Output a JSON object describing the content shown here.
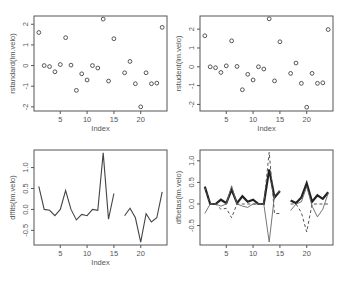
{
  "chart_data": [
    {
      "type": "scatter",
      "title": "",
      "xlabel": "Index",
      "ylabel": "rstandard(lm.velo)",
      "x": [
        1,
        2,
        3,
        4,
        5,
        6,
        7,
        8,
        9,
        10,
        11,
        12,
        13,
        14,
        15,
        16,
        17,
        18,
        19,
        20,
        21,
        22,
        23,
        24
      ],
      "values": [
        1.6,
        0.0,
        -0.05,
        -0.3,
        0.05,
        1.35,
        0.02,
        -1.2,
        -0.4,
        -0.7,
        0.0,
        -0.12,
        2.25,
        -0.75,
        1.3,
        null,
        -0.35,
        0.2,
        -0.88,
        -2.0,
        -0.35,
        -0.88,
        -0.85,
        1.85
      ],
      "xticks": [
        5,
        10,
        15,
        20
      ],
      "yticks": [
        -2,
        -1,
        0,
        1,
        2
      ],
      "xlim": [
        0.1,
        24.9
      ],
      "ylim": [
        -2.2,
        2.4
      ]
    },
    {
      "type": "scatter",
      "title": "",
      "xlabel": "Index",
      "ylabel": "rstudent(lm.velo)",
      "x": [
        1,
        2,
        3,
        4,
        5,
        6,
        7,
        8,
        9,
        10,
        11,
        12,
        13,
        14,
        15,
        16,
        17,
        18,
        19,
        20,
        21,
        22,
        23,
        24
      ],
      "values": [
        1.65,
        0.0,
        -0.05,
        -0.3,
        0.05,
        1.38,
        0.02,
        -1.22,
        -0.4,
        -0.7,
        0.0,
        -0.12,
        2.55,
        -0.75,
        1.33,
        null,
        -0.35,
        0.2,
        -0.88,
        -2.15,
        -0.35,
        -0.88,
        -0.85,
        1.98
      ],
      "xticks": [
        5,
        10,
        15,
        20
      ],
      "yticks": [
        -2,
        -1,
        0,
        1,
        2
      ],
      "xlim": [
        0.1,
        24.9
      ],
      "ylim": [
        -2.35,
        2.7
      ]
    },
    {
      "type": "line",
      "title": "",
      "xlabel": "Index",
      "ylabel": "dffits(lm.velo)",
      "x": [
        1,
        2,
        3,
        4,
        5,
        6,
        7,
        8,
        9,
        10,
        11,
        12,
        13,
        14,
        15,
        16,
        17,
        18,
        19,
        20,
        21,
        22,
        23,
        24
      ],
      "values": [
        0.55,
        0.0,
        -0.02,
        -0.15,
        0.0,
        0.45,
        0.0,
        -0.25,
        -0.12,
        -0.15,
        0.0,
        -0.02,
        1.35,
        -0.23,
        0.38,
        null,
        -0.15,
        0.03,
        -0.2,
        -0.78,
        -0.1,
        -0.3,
        -0.2,
        0.42
      ],
      "xticks": [
        5,
        10,
        15,
        20
      ],
      "yticks": [
        -0.5,
        0.0,
        0.5,
        1.0
      ],
      "xlim": [
        0.1,
        24.9
      ],
      "ylim": [
        -0.85,
        1.42
      ]
    },
    {
      "type": "line",
      "title": "",
      "xlabel": "",
      "ylabel": "dfbetas(lm.velo)",
      "x": [
        1,
        2,
        3,
        4,
        5,
        6,
        7,
        8,
        9,
        10,
        11,
        12,
        13,
        14,
        15,
        16,
        17,
        18,
        19,
        20,
        21,
        22,
        23,
        24
      ],
      "series": [
        {
          "name": "thick",
          "style": "solid-thick",
          "values": [
            0.4,
            0.0,
            0.0,
            0.1,
            0.02,
            0.33,
            0.02,
            0.18,
            0.05,
            0.1,
            0.0,
            0.0,
            0.8,
            0.15,
            0.3,
            null,
            0.08,
            0.02,
            0.15,
            0.48,
            0.05,
            0.2,
            0.12,
            0.27
          ]
        },
        {
          "name": "thin",
          "style": "solid-thin",
          "values": [
            -0.22,
            0.0,
            0.0,
            -0.05,
            0.0,
            0.42,
            0.0,
            -0.05,
            -0.08,
            0.0,
            0.0,
            0.0,
            -0.88,
            0.2,
            0.3,
            null,
            -0.15,
            0.0,
            0.05,
            0.4,
            -0.05,
            -0.3,
            -0.12,
            0.25
          ]
        },
        {
          "name": "dashed",
          "style": "dashed",
          "values": [
            0.38,
            0.0,
            0.0,
            -0.12,
            -0.1,
            -0.32,
            0.0,
            0.0,
            0.0,
            0.0,
            0.0,
            0.0,
            1.2,
            -0.22,
            -0.22,
            null,
            0.0,
            0.0,
            -0.2,
            -0.65,
            0.0,
            0.0,
            0.0,
            0.0
          ]
        }
      ],
      "xticks": [
        5,
        10,
        15,
        20
      ],
      "yticks": [
        -0.5,
        0.0,
        0.5,
        1.0
      ],
      "xlim": [
        0.1,
        24.9
      ],
      "ylim": [
        -0.95,
        1.25
      ]
    }
  ],
  "labels": {
    "p1_ylabel": "rstandard(lm.velo)",
    "p2_ylabel": "rstudent(lm.velo)",
    "p3_ylabel": "dffits(lm.velo)",
    "p4_ylabel": "dfbetas(lm.velo)",
    "xlabel": "Index"
  }
}
